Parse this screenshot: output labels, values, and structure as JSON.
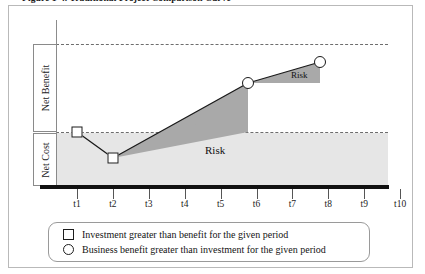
{
  "figure": {
    "caption": "Figure 1-4. Traditional Project Comparison Curve",
    "caption_truncated": true
  },
  "axes": {
    "y_labels": [
      {
        "id": "net-benefit",
        "text": "Net Benefit"
      },
      {
        "id": "net-cost",
        "text": "Net Cost"
      }
    ],
    "x_ticks": [
      "t1",
      "t2",
      "t3",
      "t4",
      "t5",
      "t6",
      "t7",
      "t8",
      "t9",
      "t10"
    ]
  },
  "annotations": [
    {
      "id": "risk-lower",
      "text": "Risk"
    },
    {
      "id": "risk-upper",
      "text": "Risk"
    }
  ],
  "legend": {
    "items": [
      {
        "marker": "square",
        "label": "Investment greater than benefit for the given period"
      },
      {
        "marker": "circle",
        "label": "Business benefit greater than investment for the given period"
      }
    ]
  },
  "colors": {
    "cost_band": "#e6e6e6",
    "risk_fill": "#a9a9a9",
    "baseline": "#111111",
    "dashed_line": "#6d6d6d",
    "frame": "#b9b9b9"
  },
  "chart_data": {
    "type": "line",
    "title": "Traditional Project Comparison Curve",
    "xlabel": "",
    "ylabel": "Net Benefit / Net Cost",
    "categories": [
      "t1",
      "t2",
      "t3",
      "t4",
      "t5",
      "t6",
      "t7",
      "t8",
      "t9",
      "t10"
    ],
    "grid": false,
    "legend_position": "bottom",
    "series": [
      {
        "name": "Project value curve",
        "points": [
          {
            "x": "t1",
            "y": 0.0,
            "marker": "square",
            "meaning": "Investment greater than benefit for the given period"
          },
          {
            "x": "t2",
            "y": -0.3,
            "marker": "square",
            "meaning": "Investment greater than benefit for the given period"
          },
          {
            "x": "t6",
            "y": 0.56,
            "marker": "circle",
            "meaning": "Business benefit greater than investment for the given period"
          },
          {
            "x": "t8",
            "y": 0.8,
            "marker": "circle",
            "meaning": "Business benefit greater than investment for the given period"
          }
        ]
      }
    ],
    "reference_lines": [
      {
        "id": "upper-dashed",
        "y": 1.0,
        "style": "dashed"
      },
      {
        "id": "breakeven-dashed",
        "y": 0.0,
        "style": "dashed",
        "note": "boundary between Net Benefit and Net Cost"
      }
    ],
    "shaded_regions": [
      {
        "id": "cost-band",
        "label": "",
        "from": "t0",
        "to": "t10",
        "fill": "#e6e6e6",
        "note": "Net Cost band below break-even"
      },
      {
        "id": "risk-lower",
        "label": "Risk",
        "from": "t2",
        "to": "t6",
        "fill": "#a9a9a9",
        "note": "risk area between curve and break-even line"
      },
      {
        "id": "risk-upper",
        "label": "Risk",
        "from": "t6",
        "to": "t8",
        "fill": "#a9a9a9",
        "note": "risk area between curve and t6 level"
      }
    ],
    "ylim": [
      -1,
      1.15
    ]
  }
}
